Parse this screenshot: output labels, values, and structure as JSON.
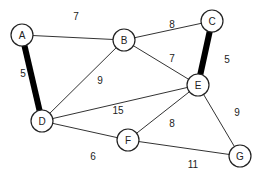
{
  "diagram": {
    "type": "weighted-undirected-graph",
    "nodes": [
      {
        "id": "A",
        "x": 22,
        "y": 35
      },
      {
        "id": "B",
        "x": 124,
        "y": 40
      },
      {
        "id": "C",
        "x": 212,
        "y": 21
      },
      {
        "id": "D",
        "x": 42,
        "y": 121
      },
      {
        "id": "E",
        "x": 198,
        "y": 85
      },
      {
        "id": "F",
        "x": 128,
        "y": 140
      },
      {
        "id": "G",
        "x": 240,
        "y": 156
      }
    ],
    "edges": [
      {
        "from": "A",
        "to": "B",
        "weight": "7",
        "highlighted": false,
        "lx": 76,
        "ly": 16
      },
      {
        "from": "A",
        "to": "D",
        "weight": "5",
        "highlighted": true,
        "lx": 23,
        "ly": 73
      },
      {
        "from": "B",
        "to": "C",
        "weight": "8",
        "highlighted": false,
        "lx": 172,
        "ly": 24
      },
      {
        "from": "B",
        "to": "D",
        "weight": "9",
        "highlighted": false,
        "lx": 100,
        "ly": 80
      },
      {
        "from": "B",
        "to": "E",
        "weight": "7",
        "highlighted": false,
        "lx": 172,
        "ly": 58
      },
      {
        "from": "C",
        "to": "E",
        "weight": "5",
        "highlighted": true,
        "lx": 227,
        "ly": 59
      },
      {
        "from": "D",
        "to": "E",
        "weight": "15",
        "highlighted": false,
        "lx": 118,
        "ly": 110
      },
      {
        "from": "D",
        "to": "F",
        "weight": "6",
        "highlighted": false,
        "lx": 93,
        "ly": 156
      },
      {
        "from": "E",
        "to": "F",
        "weight": "8",
        "highlighted": false,
        "lx": 172,
        "ly": 123
      },
      {
        "from": "E",
        "to": "G",
        "weight": "9",
        "highlighted": false,
        "lx": 237,
        "ly": 112
      },
      {
        "from": "F",
        "to": "G",
        "weight": "11",
        "highlighted": false,
        "lx": 193,
        "ly": 164
      }
    ],
    "colors": {
      "edge": "#333333",
      "highlight": "#000000",
      "node_fill": "#ffffff"
    },
    "node_radius": 11
  }
}
